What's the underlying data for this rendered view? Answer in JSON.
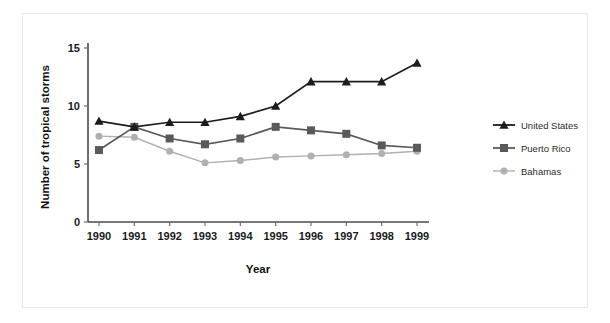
{
  "page": {
    "top_clipped_text": "",
    "background_color": "#ffffff",
    "frame_color": "#e9eaec"
  },
  "chart_data": {
    "type": "line",
    "title": "",
    "subtitle": "",
    "xlabel": "Year",
    "ylabel": "Number of tropical storms",
    "categories": [
      "1990",
      "1991",
      "1992",
      "1993",
      "1994",
      "1995",
      "1996",
      "1997",
      "1998",
      "1999"
    ],
    "x": [
      1990,
      1991,
      1992,
      1993,
      1994,
      1995,
      1996,
      1997,
      1998,
      1999
    ],
    "ylim": [
      0,
      15
    ],
    "yticks": [
      0,
      5,
      10,
      15
    ],
    "ytick_labels": [
      "0",
      "5",
      "10",
      "15"
    ],
    "grid": false,
    "legend_position": "right",
    "series": [
      {
        "name": "United States",
        "color": "#1c1c1c",
        "marker": "triangle",
        "values": [
          8.7,
          8.2,
          8.6,
          8.6,
          9.1,
          10.0,
          12.1,
          12.1,
          12.1,
          13.7
        ]
      },
      {
        "name": "Puerto Rico",
        "color": "#5a5a5a",
        "marker": "square",
        "values": [
          6.2,
          8.2,
          7.2,
          6.7,
          7.2,
          8.2,
          7.9,
          7.6,
          6.6,
          6.4
        ]
      },
      {
        "name": "Bahamas",
        "color": "#b0b0b0",
        "marker": "circle",
        "values": [
          7.4,
          7.3,
          6.1,
          5.1,
          5.3,
          5.6,
          5.7,
          5.8,
          5.9,
          6.1
        ]
      }
    ]
  },
  "legend": {
    "items": [
      {
        "label": "United States",
        "color": "#1c1c1c",
        "marker": "triangle"
      },
      {
        "label": "Puerto Rico",
        "color": "#5a5a5a",
        "marker": "square"
      },
      {
        "label": "Bahamas",
        "color": "#b0b0b0",
        "marker": "circle"
      }
    ]
  }
}
